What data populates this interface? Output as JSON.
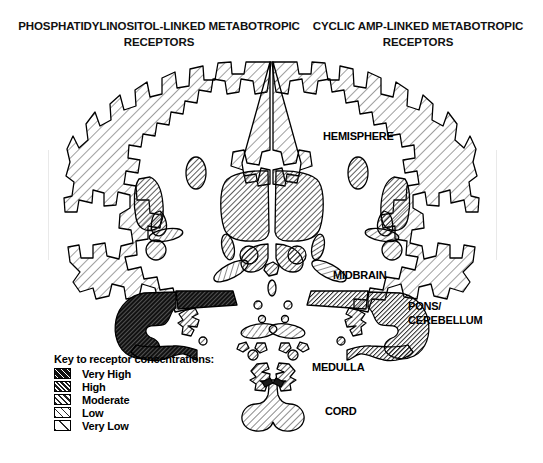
{
  "figure": {
    "type": "anatomical-diagram"
  },
  "titles": {
    "left": "PHOSPHATIDYLINOSITOL-LINKED\nMETABOTROPIC RECEPTORS",
    "right": "CYCLIC AMP-LINKED\nMETABOTROPIC RECEPTORS"
  },
  "annotations": [
    {
      "name": "hemisphere",
      "label": "HEMISPHERE",
      "x": 323,
      "y": 130
    },
    {
      "name": "midbrain",
      "label": "MIDBRAIN",
      "x": 333,
      "y": 269
    },
    {
      "name": "pons-cerebellum",
      "label": "PONS/\nCEREBELLUM",
      "x": 408,
      "y": 300
    },
    {
      "name": "medulla",
      "label": "MEDULLA",
      "x": 312,
      "y": 361
    },
    {
      "name": "cord",
      "label": "CORD",
      "x": 325,
      "y": 405
    }
  ],
  "legend": {
    "title": "Key to receptor concentrations:",
    "items": [
      {
        "label": "Very High",
        "level": 5,
        "pattern": "very-high"
      },
      {
        "label": "High",
        "level": 4,
        "pattern": "high"
      },
      {
        "label": "Moderate",
        "level": 3,
        "pattern": "moderate"
      },
      {
        "label": "Low",
        "level": 2,
        "pattern": "low"
      },
      {
        "label": "Very Low",
        "level": 1,
        "pattern": "very-low"
      }
    ]
  },
  "colors": {
    "ink": "#000000",
    "background": "#ffffff",
    "hatch": "#333333"
  },
  "regions": [
    {
      "name": "cortical-ribbon-left",
      "level": 1,
      "pattern": "very-low"
    },
    {
      "name": "cortical-ribbon-right",
      "level": 1,
      "pattern": "very-low"
    },
    {
      "name": "thalamus-left",
      "level": 3,
      "pattern": "moderate"
    },
    {
      "name": "thalamus-right",
      "level": 3,
      "pattern": "moderate"
    },
    {
      "name": "basal-ganglia-left",
      "level": 3,
      "pattern": "moderate"
    },
    {
      "name": "basal-ganglia-right",
      "level": 3,
      "pattern": "moderate"
    },
    {
      "name": "midbrain-left",
      "level": 2,
      "pattern": "low"
    },
    {
      "name": "midbrain-right",
      "level": 2,
      "pattern": "low"
    },
    {
      "name": "pons-cerebellum-left",
      "level": 5,
      "pattern": "very-high"
    },
    {
      "name": "pons-cerebellum-right",
      "level": 4,
      "pattern": "high"
    },
    {
      "name": "medulla-left",
      "level": 3,
      "pattern": "moderate"
    },
    {
      "name": "medulla-right",
      "level": 3,
      "pattern": "moderate"
    },
    {
      "name": "spinal-cord",
      "level": 2,
      "pattern": "low"
    }
  ]
}
